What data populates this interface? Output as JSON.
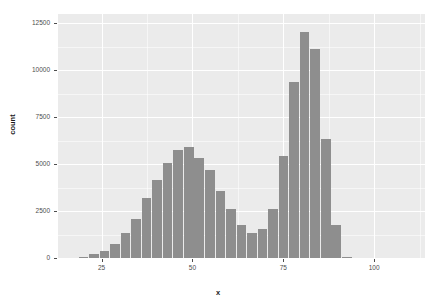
{
  "chart_data": {
    "type": "bar",
    "title": "",
    "subtitle": "",
    "xlabel": "x",
    "ylabel": "count",
    "xlim": [
      13,
      114
    ],
    "ylim": [
      0,
      13000
    ],
    "grid": true,
    "legend": null,
    "bin_width": 2.9,
    "x_ticks": [
      25,
      50,
      75,
      100
    ],
    "y_ticks": [
      0,
      2500,
      5000,
      7500,
      10000,
      12500
    ],
    "x_tick_labels": [
      "25",
      "50",
      "75",
      "100"
    ],
    "y_tick_labels": [
      "0",
      "2500",
      "5000",
      "7500",
      "10000",
      "12500"
    ],
    "bar_color": "#8e8e8e",
    "panel_color": "#ebebeb",
    "gridline_color": "#ffffff",
    "bins": [
      {
        "center": 20.1,
        "value": 40
      },
      {
        "center": 23.0,
        "value": 190
      },
      {
        "center": 25.9,
        "value": 400
      },
      {
        "center": 28.8,
        "value": 730
      },
      {
        "center": 31.7,
        "value": 1350
      },
      {
        "center": 34.6,
        "value": 2080
      },
      {
        "center": 37.5,
        "value": 3200
      },
      {
        "center": 40.4,
        "value": 4180
      },
      {
        "center": 43.3,
        "value": 5080
      },
      {
        "center": 46.2,
        "value": 5780
      },
      {
        "center": 49.1,
        "value": 5900
      },
      {
        "center": 52.0,
        "value": 5330
      },
      {
        "center": 54.9,
        "value": 4680
      },
      {
        "center": 57.8,
        "value": 3590
      },
      {
        "center": 60.7,
        "value": 2600
      },
      {
        "center": 63.6,
        "value": 1780
      },
      {
        "center": 66.5,
        "value": 1320
      },
      {
        "center": 69.4,
        "value": 1550
      },
      {
        "center": 72.3,
        "value": 2620
      },
      {
        "center": 75.2,
        "value": 5420
      },
      {
        "center": 78.1,
        "value": 9380
      },
      {
        "center": 81.0,
        "value": 12060
      },
      {
        "center": 83.9,
        "value": 11120
      },
      {
        "center": 86.8,
        "value": 6320
      },
      {
        "center": 89.7,
        "value": 1760
      },
      {
        "center": 92.6,
        "value": 60
      }
    ]
  },
  "axes": {
    "x_title": "x",
    "y_title": "count"
  }
}
